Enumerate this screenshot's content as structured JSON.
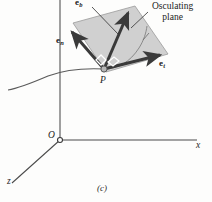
{
  "figure": {
    "caption": "(c)",
    "point_label": "P",
    "origin_label": "O",
    "callout": {
      "line1": "Osculating",
      "line2": "plane"
    },
    "vectors": [
      {
        "name": "binormal",
        "base": "e",
        "subscript": "b"
      },
      {
        "name": "normal",
        "base": "e",
        "subscript": "n"
      },
      {
        "name": "tangent",
        "base": "e",
        "subscript": "t"
      }
    ],
    "axes": [
      {
        "name": "x-axis",
        "label": "x"
      },
      {
        "name": "z-axis",
        "label": "z"
      }
    ],
    "colors": {
      "plane_fill": "#c9c9c9",
      "plane_edge": "#8f8f8f",
      "arrow": "#3a3a3a",
      "curve": "#5a5a5a",
      "axis": "#4a4a4a",
      "background": "#fdfdfc"
    }
  }
}
